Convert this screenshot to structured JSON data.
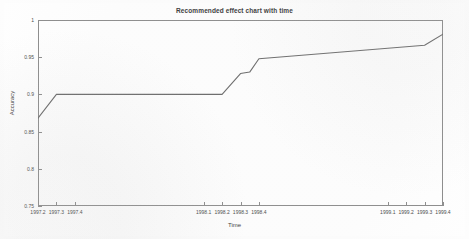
{
  "chart_data": {
    "type": "line",
    "title": "Recommended effect chart with time",
    "xlabel": "Time",
    "ylabel": "Accuracy",
    "xlim": [
      1997.2,
      1999.4
    ],
    "ylim": [
      0.75,
      1
    ],
    "xticks": [
      "1997.2",
      "1997.3",
      "1997.4",
      "1998.1",
      "1998.2",
      "1998.3",
      "1998.4",
      "1999.1",
      "1999.2",
      "1999.3",
      "1999.4"
    ],
    "xtick_values": [
      1997.2,
      1997.3,
      1997.4,
      1998.1,
      1998.2,
      1998.3,
      1998.4,
      1999.1,
      1999.2,
      1999.3,
      1999.4
    ],
    "yticks": [
      "0.75",
      "0.8",
      "0.85",
      "0.9",
      "0.95",
      "1"
    ],
    "ytick_values": [
      0.75,
      0.8,
      0.85,
      0.9,
      0.95,
      1
    ],
    "grid": false,
    "legend": null,
    "line_color": "#6b6b6b",
    "series": [
      {
        "name": "Accuracy",
        "x": [
          1997.2,
          1997.3,
          1998.2,
          1998.3,
          1998.35,
          1998.4,
          1999.3,
          1999.4
        ],
        "y": [
          0.868,
          0.9,
          0.9,
          0.928,
          0.93,
          0.948,
          0.966,
          0.981
        ]
      }
    ]
  },
  "axes": {
    "title": "Recommended effect chart with time",
    "x_axis_title": "Time",
    "y_axis_title": "Accuracy"
  }
}
